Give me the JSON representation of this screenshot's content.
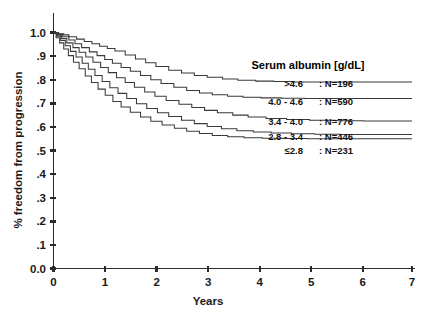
{
  "chart_data": {
    "type": "line",
    "title": "",
    "xlabel": "Years",
    "ylabel": "% freedom from progression",
    "xlim": [
      0,
      7
    ],
    "ylim": [
      0.0,
      1.0
    ],
    "grid": false,
    "legend_position": "right-inside",
    "legend_title": "Serum albumin [g/dL]",
    "xticks": [
      "0",
      "1",
      "2",
      "3",
      "4",
      "5",
      "6",
      "7"
    ],
    "xtick_values": [
      0,
      1,
      2,
      3,
      4,
      5,
      6,
      7
    ],
    "yticks": [
      "0.0",
      ".1",
      ".2",
      ".3",
      ".4",
      ".5",
      ".6",
      ".7",
      ".8",
      ".9",
      "1.0"
    ],
    "ytick_values": [
      0.0,
      0.1,
      0.2,
      0.3,
      0.4,
      0.5,
      0.6,
      0.7,
      0.8,
      0.9,
      1.0
    ],
    "series": [
      {
        "name": ">4.6",
        "n_label": ": N=196",
        "n": 196,
        "color": "#3a3a3a",
        "points": [
          [
            0.0,
            1.0
          ],
          [
            0.1,
            0.995
          ],
          [
            0.2,
            0.99
          ],
          [
            0.3,
            0.982
          ],
          [
            0.45,
            0.972
          ],
          [
            0.6,
            0.962
          ],
          [
            0.75,
            0.952
          ],
          [
            0.9,
            0.942
          ],
          [
            1.05,
            0.932
          ],
          [
            1.2,
            0.922
          ],
          [
            1.4,
            0.905
          ],
          [
            1.6,
            0.888
          ],
          [
            1.8,
            0.872
          ],
          [
            2.0,
            0.856
          ],
          [
            2.25,
            0.84
          ],
          [
            2.5,
            0.828
          ],
          [
            2.75,
            0.818
          ],
          [
            3.0,
            0.81
          ],
          [
            3.3,
            0.803
          ],
          [
            3.6,
            0.798
          ],
          [
            3.95,
            0.794
          ],
          [
            4.3,
            0.792
          ],
          [
            4.7,
            0.79
          ],
          [
            5.1,
            0.79
          ],
          [
            5.6,
            0.79
          ],
          [
            6.1,
            0.79
          ],
          [
            6.6,
            0.79
          ],
          [
            7.0,
            0.79
          ]
        ]
      },
      {
        "name": "4.0 - 4.6",
        "n_label": ": N=590",
        "n": 590,
        "color": "#3a3a3a",
        "points": [
          [
            0.0,
            1.0
          ],
          [
            0.08,
            0.992
          ],
          [
            0.18,
            0.982
          ],
          [
            0.3,
            0.968
          ],
          [
            0.42,
            0.952
          ],
          [
            0.55,
            0.936
          ],
          [
            0.7,
            0.918
          ],
          [
            0.85,
            0.902
          ],
          [
            1.0,
            0.886
          ],
          [
            1.15,
            0.87
          ],
          [
            1.32,
            0.852
          ],
          [
            1.5,
            0.836
          ],
          [
            1.7,
            0.818
          ],
          [
            1.9,
            0.8
          ],
          [
            2.1,
            0.784
          ],
          [
            2.35,
            0.768
          ],
          [
            2.6,
            0.754
          ],
          [
            2.85,
            0.744
          ],
          [
            3.1,
            0.736
          ],
          [
            3.4,
            0.73
          ],
          [
            3.7,
            0.726
          ],
          [
            4.05,
            0.723
          ],
          [
            4.45,
            0.721
          ],
          [
            4.9,
            0.72
          ],
          [
            5.4,
            0.72
          ],
          [
            5.95,
            0.72
          ],
          [
            6.5,
            0.72
          ],
          [
            7.0,
            0.72
          ]
        ]
      },
      {
        "name": "3.4 - 4.0",
        "n_label": ": N=776",
        "n": 776,
        "color": "#3a3a3a",
        "points": [
          [
            0.0,
            1.0
          ],
          [
            0.07,
            0.988
          ],
          [
            0.16,
            0.974
          ],
          [
            0.26,
            0.956
          ],
          [
            0.38,
            0.936
          ],
          [
            0.5,
            0.916
          ],
          [
            0.63,
            0.896
          ],
          [
            0.77,
            0.874
          ],
          [
            0.92,
            0.852
          ],
          [
            1.07,
            0.83
          ],
          [
            1.23,
            0.808
          ],
          [
            1.4,
            0.788
          ],
          [
            1.58,
            0.768
          ],
          [
            1.78,
            0.748
          ],
          [
            1.98,
            0.73
          ],
          [
            2.2,
            0.712
          ],
          [
            2.45,
            0.696
          ],
          [
            2.7,
            0.682
          ],
          [
            2.95,
            0.67
          ],
          [
            3.2,
            0.66
          ],
          [
            3.5,
            0.65
          ],
          [
            3.8,
            0.642
          ],
          [
            4.15,
            0.636
          ],
          [
            4.55,
            0.631
          ],
          [
            5.0,
            0.628
          ],
          [
            5.5,
            0.626
          ],
          [
            6.05,
            0.625
          ],
          [
            6.55,
            0.625
          ],
          [
            7.0,
            0.625
          ]
        ]
      },
      {
        "name": "2.8 - 3.4",
        "n_label": ": N=446",
        "n": 446,
        "color": "#3a3a3a",
        "points": [
          [
            0.0,
            1.0
          ],
          [
            0.06,
            0.984
          ],
          [
            0.14,
            0.966
          ],
          [
            0.23,
            0.944
          ],
          [
            0.33,
            0.92
          ],
          [
            0.44,
            0.896
          ],
          [
            0.56,
            0.87
          ],
          [
            0.68,
            0.844
          ],
          [
            0.81,
            0.818
          ],
          [
            0.95,
            0.792
          ],
          [
            1.1,
            0.766
          ],
          [
            1.26,
            0.742
          ],
          [
            1.43,
            0.72
          ],
          [
            1.62,
            0.698
          ],
          [
            1.82,
            0.678
          ],
          [
            2.03,
            0.66
          ],
          [
            2.25,
            0.644
          ],
          [
            2.5,
            0.628
          ],
          [
            2.75,
            0.614
          ],
          [
            3.0,
            0.602
          ],
          [
            3.28,
            0.592
          ],
          [
            3.58,
            0.584
          ],
          [
            3.9,
            0.578
          ],
          [
            4.25,
            0.574
          ],
          [
            4.65,
            0.571
          ],
          [
            5.1,
            0.569
          ],
          [
            5.6,
            0.568
          ],
          [
            6.15,
            0.568
          ],
          [
            6.6,
            0.568
          ],
          [
            7.0,
            0.568
          ]
        ]
      },
      {
        "name": "≤2.8",
        "n_label": ": N=231",
        "n": 231,
        "color": "#3a3a3a",
        "points": [
          [
            0.0,
            1.0
          ],
          [
            0.05,
            0.978
          ],
          [
            0.12,
            0.956
          ],
          [
            0.2,
            0.93
          ],
          [
            0.29,
            0.902
          ],
          [
            0.39,
            0.874
          ],
          [
            0.5,
            0.846
          ],
          [
            0.62,
            0.816
          ],
          [
            0.74,
            0.788
          ],
          [
            0.87,
            0.76
          ],
          [
            1.01,
            0.734
          ],
          [
            1.16,
            0.708
          ],
          [
            1.32,
            0.684
          ],
          [
            1.5,
            0.662
          ],
          [
            1.7,
            0.642
          ],
          [
            1.9,
            0.624
          ],
          [
            2.12,
            0.608
          ],
          [
            2.36,
            0.594
          ],
          [
            2.6,
            0.582
          ],
          [
            2.85,
            0.572
          ],
          [
            3.1,
            0.564
          ],
          [
            3.4,
            0.558
          ],
          [
            3.72,
            0.554
          ],
          [
            4.08,
            0.552
          ],
          [
            4.48,
            0.551
          ],
          [
            4.95,
            0.55
          ],
          [
            5.45,
            0.55
          ],
          [
            6.0,
            0.55
          ],
          [
            6.55,
            0.55
          ],
          [
            7.0,
            0.55
          ]
        ]
      }
    ]
  },
  "legend": {
    "title": "Serum albumin [g/dL]",
    "entries": [
      {
        "category": ">4.6",
        "n_text": ": N=196"
      },
      {
        "category": "4.0 - 4.6",
        "n_text": ": N=590"
      },
      {
        "category": "3.4 - 4.0",
        "n_text": ": N=776"
      },
      {
        "category": "2.8 - 3.4",
        "n_text": ": N=446"
      },
      {
        "category": "≤2.8",
        "n_text": ": N=231"
      }
    ]
  },
  "axes": {
    "y_title": "% freedom from progression",
    "x_title": "Years",
    "y_tick_labels": [
      "1.0",
      ".9",
      ".8",
      ".7",
      ".6",
      ".5",
      ".4",
      ".3",
      ".2",
      ".1",
      "0.0"
    ],
    "x_tick_labels": [
      "0",
      "1",
      "2",
      "3",
      "4",
      "5",
      "6",
      "7"
    ]
  },
  "colors": {
    "background": "#ffffff",
    "axis": "#2b2b2b",
    "curve": "#3a3a3a",
    "text": "#111111"
  }
}
